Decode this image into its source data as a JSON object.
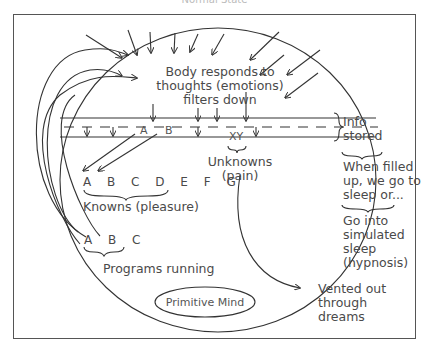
{
  "title": "Normal State",
  "labels": {
    "body_responds": "Body responds to\nthoughts (emotions)\nfilters down",
    "band_letter_a": "A",
    "band_letter_b": "B",
    "band_letters_xy": "XY",
    "info_stored": "Info\nstored",
    "when_filled": "When filled\nup, we go to\nsleep or...",
    "simulated_sleep": "Go into\nsimulated\nsleep\n(hypnosis)",
    "unknowns": "Unknowns\n(pain)",
    "knowns_letters": "A B C D E F G",
    "knowns": "Knowns (pleasure)",
    "programs_letters": "A B C",
    "programs": "Programs running",
    "primitive_mind": "Primitive Mind",
    "vented": "Vented out\nthrough\ndreams"
  },
  "colors": {
    "line": "#333333",
    "text": "#4a4a4a",
    "frame": "#555555"
  }
}
